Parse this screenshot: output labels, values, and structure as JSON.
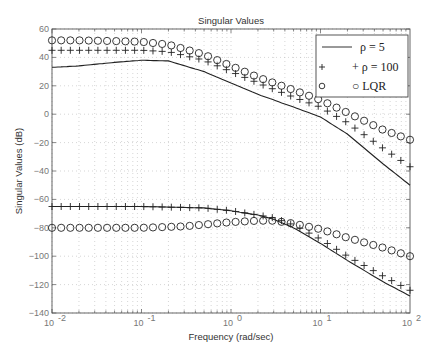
{
  "chart_data": {
    "type": "line",
    "title": "Singular Values",
    "xlabel": "Frequency (rad/sec)",
    "ylabel": "Singular Values (dB)",
    "xscale": "log",
    "xlim": [
      0.01,
      100
    ],
    "ylim": [
      -140,
      60
    ],
    "xticks": [
      "10^-2",
      "10^-1",
      "10^0",
      "10^1",
      "10^2"
    ],
    "yticks": [
      60,
      40,
      20,
      0,
      -20,
      -40,
      -60,
      -80,
      -100,
      -120,
      -140
    ],
    "grid": true,
    "legend_position": "upper right",
    "legend": [
      "ρ = 5",
      "+ ρ = 100",
      "○ LQR"
    ],
    "series": [
      {
        "name": "ρ = 5 (σmax)",
        "style": "solid-line",
        "x": [
          0.01,
          0.02,
          0.05,
          0.1,
          0.2,
          0.5,
          1,
          2,
          5,
          10,
          20,
          50,
          100
        ],
        "y": [
          33,
          34,
          36.5,
          38,
          37.5,
          30,
          22,
          14,
          5,
          -2,
          -14,
          -35,
          -50
        ]
      },
      {
        "name": "ρ = 100 (σmax)",
        "style": "plus-markers",
        "x": [
          0.01,
          0.02,
          0.05,
          0.1,
          0.2,
          0.5,
          1,
          2,
          5,
          10,
          20,
          50,
          100
        ],
        "y": [
          45,
          45,
          45,
          45,
          44,
          38,
          30,
          22,
          12,
          5,
          -6,
          -24,
          -37
        ]
      },
      {
        "name": "LQR (σmax)",
        "style": "circle-markers",
        "x": [
          0.01,
          0.02,
          0.05,
          0.1,
          0.2,
          0.5,
          1,
          2,
          5,
          10,
          20,
          50,
          100
        ],
        "y": [
          52,
          52,
          51.5,
          51,
          49,
          42,
          34,
          26,
          17,
          10,
          1,
          -11,
          -18
        ]
      },
      {
        "name": "ρ = 5 (σmin)",
        "style": "solid-line",
        "x": [
          0.01,
          0.1,
          0.5,
          1,
          2,
          3,
          5,
          10,
          20,
          50,
          100
        ],
        "y": [
          -65,
          -65,
          -66,
          -68,
          -71,
          -74,
          -80,
          -91,
          -103,
          -118,
          -128
        ]
      },
      {
        "name": "ρ = 100 (σmin)",
        "style": "plus-markers",
        "x": [
          0.01,
          0.1,
          0.5,
          1,
          2,
          3,
          5,
          10,
          20,
          50,
          100
        ],
        "y": [
          -65,
          -65,
          -66,
          -68,
          -71,
          -73,
          -78,
          -88,
          -100,
          -114,
          -124
        ]
      },
      {
        "name": "LQR (σmin)",
        "style": "circle-markers",
        "x": [
          0.01,
          0.1,
          0.3,
          1,
          2,
          3,
          5,
          10,
          20,
          50,
          100
        ],
        "y": [
          -80,
          -80,
          -79,
          -76,
          -75,
          -75,
          -77,
          -81,
          -87,
          -94,
          -100
        ]
      }
    ]
  }
}
